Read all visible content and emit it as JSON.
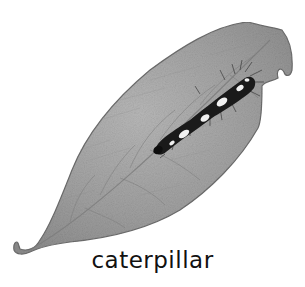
{
  "figure": {
    "caption": "caterpillar",
    "colors": {
      "background": "#ffffff",
      "leaf_fill": "#9a9a9a",
      "leaf_light": "#b4b4b4",
      "leaf_outline": "#6e6e6e",
      "vein": "#7a7a7a",
      "caterpillar_body": "#1a1a1a",
      "caterpillar_spots": "#f0f0f0",
      "caption_text": "#111111"
    }
  }
}
